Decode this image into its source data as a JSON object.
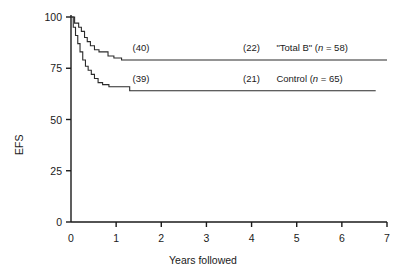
{
  "chart_data": {
    "type": "line",
    "title": "",
    "xlabel": "Years followed",
    "ylabel": "EFS",
    "xlim": [
      0,
      7
    ],
    "ylim": [
      0,
      100
    ],
    "xticks": [
      "0",
      "1",
      "2",
      "3",
      "4",
      "5",
      "6",
      "7"
    ],
    "yticks": [
      "0",
      "25",
      "50",
      "75",
      "100"
    ],
    "grid": false,
    "legend_position": "inline-right",
    "series": [
      {
        "name": "\"Total B\"",
        "n": 58,
        "label_text": "\"Total B\" (n = 58)",
        "label_prefix": "\"Total B\" (",
        "label_italic": "n",
        "label_suffix": " = 58)",
        "color": "#2b2b2b",
        "plateau_value": 79,
        "risk_annotations": [
          {
            "label": "(40)",
            "x_year": 1.55,
            "y_value": 79
          },
          {
            "label": "(22)",
            "x_year": 4.0,
            "y_value": 79
          }
        ],
        "steps": [
          {
            "x": 0.0,
            "y": 100
          },
          {
            "x": 0.08,
            "y": 100
          },
          {
            "x": 0.08,
            "y": 97
          },
          {
            "x": 0.17,
            "y": 97
          },
          {
            "x": 0.17,
            "y": 95
          },
          {
            "x": 0.23,
            "y": 95
          },
          {
            "x": 0.23,
            "y": 93
          },
          {
            "x": 0.3,
            "y": 93
          },
          {
            "x": 0.3,
            "y": 90
          },
          {
            "x": 0.36,
            "y": 90
          },
          {
            "x": 0.36,
            "y": 88
          },
          {
            "x": 0.43,
            "y": 88
          },
          {
            "x": 0.43,
            "y": 86
          },
          {
            "x": 0.52,
            "y": 86
          },
          {
            "x": 0.52,
            "y": 84
          },
          {
            "x": 0.62,
            "y": 84
          },
          {
            "x": 0.62,
            "y": 83
          },
          {
            "x": 0.82,
            "y": 83
          },
          {
            "x": 0.82,
            "y": 81
          },
          {
            "x": 0.95,
            "y": 81
          },
          {
            "x": 0.95,
            "y": 80
          },
          {
            "x": 1.12,
            "y": 80
          },
          {
            "x": 1.12,
            "y": 79
          },
          {
            "x": 7.0,
            "y": 79
          }
        ]
      },
      {
        "name": "Control",
        "n": 65,
        "label_text": "Control (n = 65)",
        "label_prefix": "Control (",
        "label_italic": "n",
        "label_suffix": " = 65)",
        "color": "#2b2b2b",
        "plateau_value": 64,
        "risk_annotations": [
          {
            "label": "(39)",
            "x_year": 1.55,
            "y_value": 64
          },
          {
            "label": "(21)",
            "x_year": 4.0,
            "y_value": 64
          }
        ],
        "steps": [
          {
            "x": 0.0,
            "y": 100
          },
          {
            "x": 0.05,
            "y": 100
          },
          {
            "x": 0.05,
            "y": 95
          },
          {
            "x": 0.1,
            "y": 95
          },
          {
            "x": 0.1,
            "y": 91
          },
          {
            "x": 0.15,
            "y": 91
          },
          {
            "x": 0.15,
            "y": 87
          },
          {
            "x": 0.2,
            "y": 87
          },
          {
            "x": 0.2,
            "y": 83
          },
          {
            "x": 0.26,
            "y": 83
          },
          {
            "x": 0.26,
            "y": 79
          },
          {
            "x": 0.32,
            "y": 79
          },
          {
            "x": 0.32,
            "y": 76
          },
          {
            "x": 0.38,
            "y": 76
          },
          {
            "x": 0.38,
            "y": 74
          },
          {
            "x": 0.45,
            "y": 74
          },
          {
            "x": 0.45,
            "y": 72
          },
          {
            "x": 0.52,
            "y": 72
          },
          {
            "x": 0.52,
            "y": 70
          },
          {
            "x": 0.6,
            "y": 70
          },
          {
            "x": 0.6,
            "y": 68
          },
          {
            "x": 0.7,
            "y": 68
          },
          {
            "x": 0.7,
            "y": 67
          },
          {
            "x": 0.84,
            "y": 67
          },
          {
            "x": 0.84,
            "y": 66
          },
          {
            "x": 1.3,
            "y": 66
          },
          {
            "x": 1.3,
            "y": 64
          },
          {
            "x": 6.75,
            "y": 64
          }
        ]
      }
    ]
  }
}
